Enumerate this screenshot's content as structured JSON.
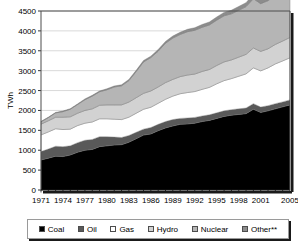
{
  "chart_data": {
    "type": "area",
    "stacked": true,
    "title": "",
    "xlabel": "",
    "ylabel": "TWh",
    "ylim": [
      0,
      4500
    ],
    "ytick_step": 500,
    "yticks": [
      "0",
      "500",
      "1000",
      "1500",
      "2000",
      "2500",
      "3000",
      "3500",
      "4000",
      "4500"
    ],
    "grid": true,
    "legend_position": "bottom",
    "x": [
      1971,
      1972,
      1973,
      1974,
      1975,
      1976,
      1977,
      1978,
      1979,
      1980,
      1981,
      1982,
      1983,
      1984,
      1985,
      1986,
      1987,
      1988,
      1989,
      1990,
      1991,
      1992,
      1993,
      1994,
      1995,
      1996,
      1997,
      1998,
      1999,
      2000,
      2001,
      2002,
      2003,
      2004,
      2005
    ],
    "xtick_labels": [
      "1971",
      "1974",
      "1977",
      "1980",
      "1983",
      "1986",
      "1989",
      "1992",
      "1995",
      "1998",
      "2001",
      "2005"
    ],
    "xticks": [
      1971,
      1974,
      1977,
      1980,
      1983,
      1986,
      1989,
      1992,
      1995,
      1998,
      2001,
      2005
    ],
    "series": [
      {
        "name": "Coal",
        "color": "#000000",
        "values": [
          755,
          800,
          850,
          840,
          880,
          950,
          1000,
          1020,
          1090,
          1110,
          1130,
          1140,
          1200,
          1290,
          1380,
          1410,
          1490,
          1560,
          1610,
          1650,
          1660,
          1680,
          1720,
          1750,
          1800,
          1850,
          1880,
          1900,
          1920,
          2030,
          1950,
          1990,
          2040,
          2090,
          2140
        ]
      },
      {
        "name": "Oil",
        "color": "#595959",
        "values": [
          210,
          230,
          250,
          250,
          230,
          240,
          250,
          250,
          250,
          230,
          200,
          180,
          170,
          160,
          150,
          160,
          160,
          160,
          160,
          150,
          150,
          145,
          140,
          140,
          140,
          140,
          140,
          140,
          140,
          140,
          135,
          130,
          130,
          125,
          125
        ]
      },
      {
        "name": "Gas",
        "color": "#ffffff",
        "values": [
          420,
          430,
          440,
          430,
          420,
          430,
          430,
          440,
          450,
          450,
          450,
          450,
          460,
          480,
          500,
          510,
          530,
          560,
          590,
          620,
          640,
          650,
          670,
          690,
          730,
          760,
          780,
          820,
          860,
          900,
          910,
          950,
          1000,
          1030,
          1060
        ]
      },
      {
        "name": "Hydro",
        "color": "#d2d2d2",
        "values": [
          270,
          280,
          290,
          310,
          310,
          310,
          320,
          330,
          340,
          350,
          360,
          370,
          380,
          390,
          400,
          410,
          410,
          420,
          420,
          430,
          440,
          440,
          450,
          450,
          460,
          470,
          470,
          480,
          490,
          500,
          490,
          480,
          490,
          500,
          510
        ]
      },
      {
        "name": "Nuclear",
        "color": "#b5b5b5",
        "values": [
          60,
          80,
          110,
          140,
          190,
          220,
          270,
          320,
          340,
          380,
          450,
          480,
          540,
          660,
          790,
          840,
          900,
          990,
          1040,
          1060,
          1090,
          1100,
          1110,
          1120,
          1140,
          1160,
          1160,
          1180,
          1200,
          1240,
          1200,
          1210,
          1230,
          1250,
          1270
        ]
      },
      {
        "name": "Other**",
        "color": "#8c8c8c",
        "values": [
          10,
          10,
          10,
          15,
          15,
          15,
          20,
          20,
          20,
          25,
          25,
          25,
          30,
          30,
          35,
          35,
          40,
          45,
          50,
          55,
          60,
          65,
          70,
          75,
          80,
          85,
          90,
          95,
          100,
          110,
          115,
          120,
          130,
          140,
          150
        ]
      }
    ]
  },
  "legend": {
    "items": [
      {
        "label": "Coal",
        "color": "#000000"
      },
      {
        "label": "Oil",
        "color": "#595959"
      },
      {
        "label": "Gas",
        "color": "#ffffff"
      },
      {
        "label": "Hydro",
        "color": "#d2d2d2"
      },
      {
        "label": "Nuclear",
        "color": "#b5b5b5"
      },
      {
        "label": "Other**",
        "color": "#8c8c8c"
      }
    ]
  },
  "style": {
    "plot_border_color": "#4d4d4d",
    "shadow_color": "#1a1a1a",
    "grid_color": "#c8c8c8",
    "axis_color": "#000000"
  }
}
